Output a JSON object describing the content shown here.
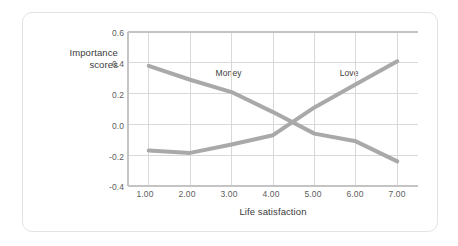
{
  "figure": {
    "background_color": "#ffffff",
    "card_border_color": "#e3e3e3"
  },
  "chart_data": {
    "type": "line",
    "title": "",
    "xlabel": "Life satisfaction",
    "ylabel": "Importance\nscores",
    "ylabel_line1": "Importance",
    "ylabel_line2": "scores",
    "x": [
      1,
      2,
      3,
      4,
      5,
      6,
      7
    ],
    "xtick_labels": [
      "1.00",
      "2.00",
      "3.00",
      "4.00",
      "5.00",
      "6.00",
      "7.00"
    ],
    "ytick_labels": [
      "0.6",
      "0.4",
      "0.2",
      "0.0",
      "-0.2",
      "-0.4"
    ],
    "yticks": [
      0.6,
      0.4,
      0.2,
      0.0,
      -0.2,
      -0.4
    ],
    "xlim": [
      0.5,
      7.5
    ],
    "ylim": [
      -0.4,
      0.6
    ],
    "grid": true,
    "grid_color": "#d9d9d9",
    "legend_position": "inline-annotations",
    "line_color": "#a9a9a9",
    "line_width": 4,
    "series": [
      {
        "name": "Money",
        "values": [
          0.38,
          0.29,
          0.21,
          0.08,
          -0.06,
          -0.11,
          -0.24
        ],
        "label_x": 3.0,
        "label_y": 0.33,
        "color": "#a9a9a9"
      },
      {
        "name": "Love",
        "values": [
          -0.17,
          -0.185,
          -0.13,
          -0.07,
          0.11,
          0.26,
          0.41
        ],
        "label_x": 5.9,
        "label_y": 0.33,
        "color": "#a9a9a9"
      }
    ],
    "annotations": [
      {
        "text": "Money",
        "x": 3.0,
        "y": 0.33
      },
      {
        "text": "Love",
        "x": 5.9,
        "y": 0.33
      }
    ]
  }
}
